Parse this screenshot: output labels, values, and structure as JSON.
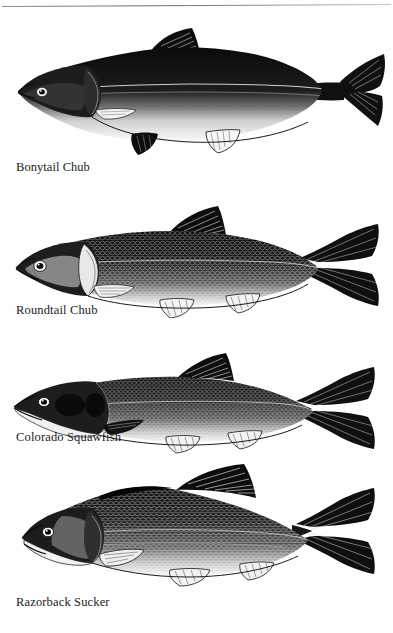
{
  "page": {
    "background_color": "#fefefe",
    "ink_color": "#1b1b1b",
    "has_top_rule": true,
    "top_rule_color": "#6e6e6e"
  },
  "plates": [
    {
      "id": "bonytail-chub",
      "caption": "Bonytail Chub",
      "caption_spacing": "tight",
      "illustration": "side-view engraving of a bonytail chub with dark stippled back, pale belly, nuchal hump, very slender caudal peduncle and deeply forked tail",
      "body_fill": "#111111",
      "belly_fill": "#fbfbfb",
      "orientation": "facing-left"
    },
    {
      "id": "roundtail-chub",
      "caption": "Roundtail Chub",
      "caption_spacing": "normal",
      "illustration": "side-view engraving of a roundtail chub with cross-hatched scale texture, visible eye, rounded snout and forked tail",
      "body_fill": "#141414",
      "belly_fill": "#fafafa",
      "orientation": "facing-left"
    },
    {
      "id": "colorado-squawfish",
      "caption": "Colorado Squawfish",
      "caption_spacing": "normal",
      "illustration": "side-view engraving of a colorado squawfish with elongated pike-like head, long snout, slender body and forked tail",
      "body_fill": "#151515",
      "belly_fill": "#fafafa",
      "orientation": "facing-left"
    },
    {
      "id": "razorback-sucker",
      "caption": "Razorback Sucker",
      "caption_spacing": "normal",
      "illustration": "side-view engraving of a razorback sucker with sharp keeled hump behind the head, deep body, subterminal mouth and forked tail",
      "body_fill": "#131313",
      "belly_fill": "#fafafa",
      "orientation": "facing-left"
    }
  ]
}
